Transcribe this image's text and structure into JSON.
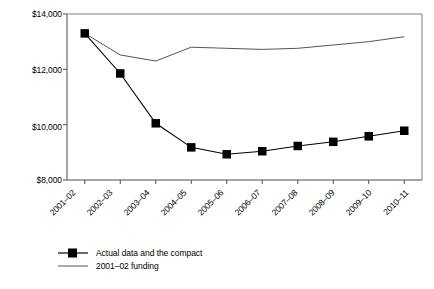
{
  "chart_data": {
    "type": "line",
    "title": "",
    "subtitle": "",
    "xlabel": "",
    "ylabel": "",
    "categories": [
      "2001–02",
      "2002–03",
      "2003–04",
      "2004–05",
      "2005–06",
      "2006–07",
      "2007–08",
      "2008–09",
      "2009–10",
      "2010–11"
    ],
    "ylim": [
      8000,
      14000
    ],
    "ytick_values": [
      8000,
      10000,
      12000,
      14000
    ],
    "ytick_labels": [
      "$8,000",
      "$10,000",
      "$12,000",
      "$14,000"
    ],
    "grid": false,
    "legend_position": "bottom-left",
    "series": [
      {
        "name": "Actual data and the compact",
        "marker": "square",
        "color": "#000000",
        "values": [
          13300,
          11850,
          10050,
          9180,
          8930,
          9040,
          9230,
          9380,
          9580,
          9780
        ]
      },
      {
        "name": "2001–02 funding",
        "marker": "none",
        "color": "#555555",
        "values": [
          13300,
          12520,
          12300,
          12800,
          12760,
          12720,
          12760,
          12880,
          13000,
          13180
        ]
      }
    ]
  },
  "axis": {
    "y_ticks": [
      {
        "label": "$14,000",
        "value": 14000
      },
      {
        "label": "$12,000",
        "value": 12000
      },
      {
        "label": "$10,000",
        "value": 10000
      },
      {
        "label": "$8,000",
        "value": 8000
      }
    ],
    "x_ticks": [
      {
        "label": "2001–02"
      },
      {
        "label": "2002–03"
      },
      {
        "label": "2003–04"
      },
      {
        "label": "2004–05"
      },
      {
        "label": "2005–06"
      },
      {
        "label": "2006–07"
      },
      {
        "label": "2007–08"
      },
      {
        "label": "2008–09"
      },
      {
        "label": "2009–10"
      },
      {
        "label": "2010–11"
      }
    ]
  },
  "legend": {
    "items": [
      {
        "label": "Actual data and the compact",
        "swatch": "line-with-square-marker"
      },
      {
        "label": "2001–02 funding",
        "swatch": "thin-line"
      }
    ]
  }
}
